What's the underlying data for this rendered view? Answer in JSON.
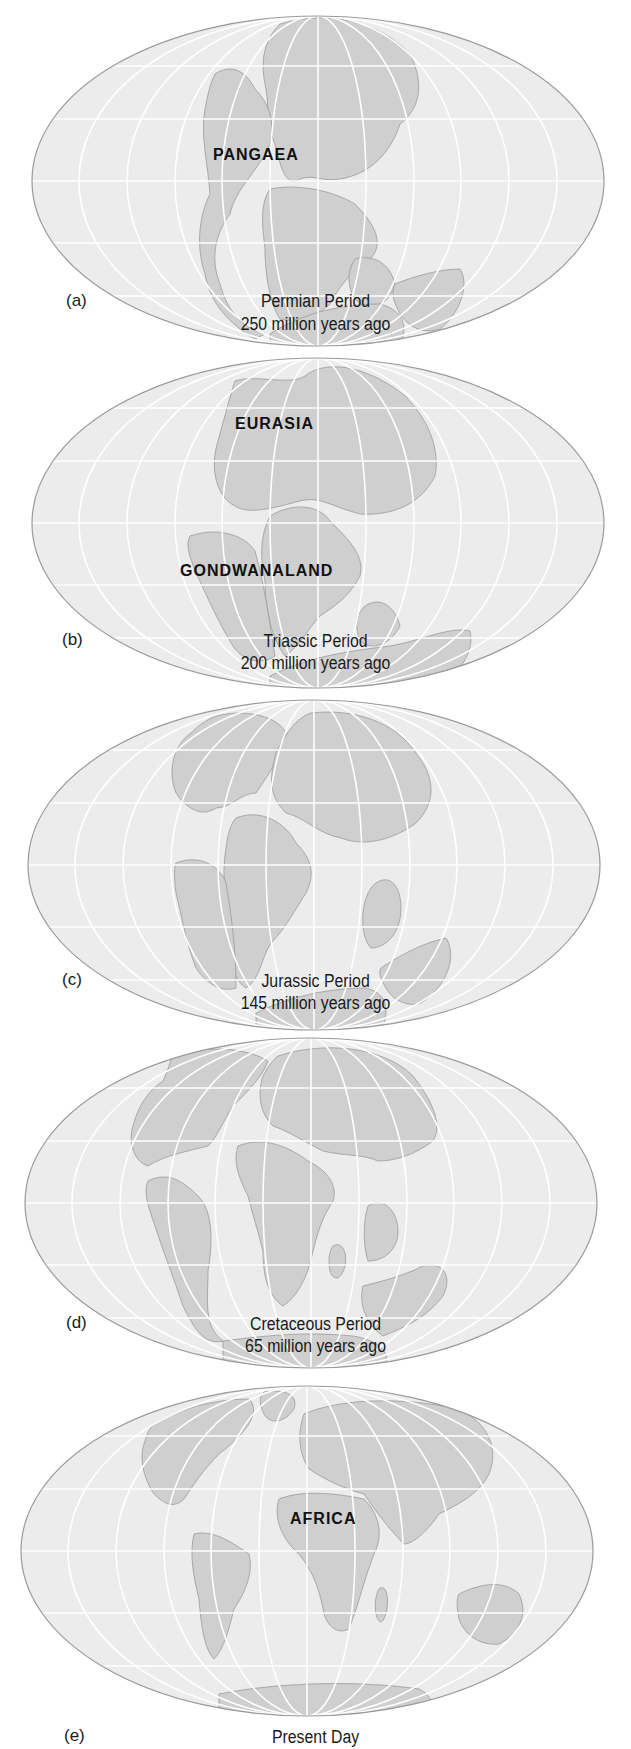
{
  "figure": {
    "colors": {
      "ocean": "#ececec",
      "land": "#cfcfcf",
      "grid": "#ffffff",
      "outline": "#9a9a9a",
      "text": "#1a1a1a"
    },
    "panels": [
      {
        "letter": "(a)",
        "period": "Permian Period",
        "age": "250 million years ago",
        "labels": [
          "PANGAEA"
        ]
      },
      {
        "letter": "(b)",
        "period": "Triassic Period",
        "age": "200 million years ago",
        "labels": [
          "EURASIA",
          "GONDWANALAND"
        ]
      },
      {
        "letter": "(c)",
        "period": "Jurassic Period",
        "age": "145 million years ago",
        "labels": []
      },
      {
        "letter": "(d)",
        "period": "Cretaceous Period",
        "age": "65 million years ago",
        "labels": []
      },
      {
        "letter": "(e)",
        "period": "Present Day",
        "age": "",
        "labels": [
          "AFRICA"
        ]
      }
    ]
  }
}
